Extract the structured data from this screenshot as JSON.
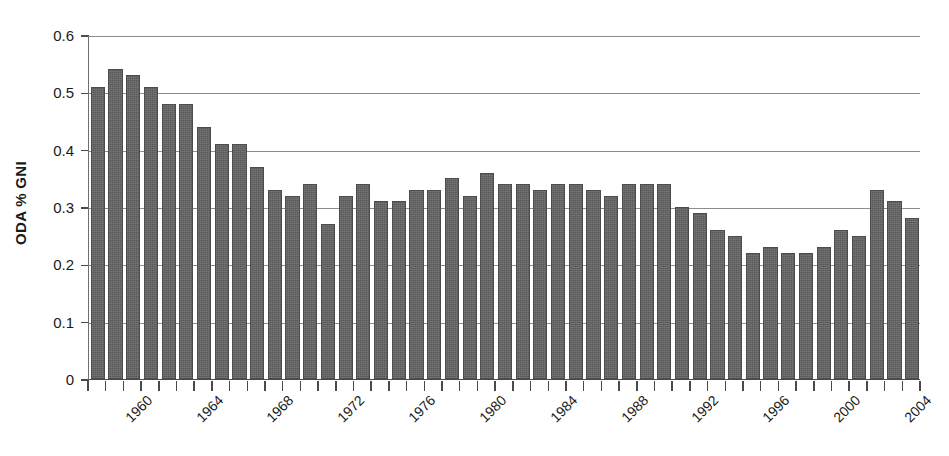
{
  "chart_data": {
    "type": "bar",
    "title": "",
    "subtitle": "",
    "xlabel": "",
    "ylabel": "ODA % GNI",
    "ylim": [
      0,
      0.6
    ],
    "ytick_labels": [
      "0.6",
      "0.5",
      "0.4",
      "0.3",
      "0.2",
      "0.1",
      "0"
    ],
    "ytick_values": [
      0.6,
      0.5,
      0.4,
      0.3,
      0.2,
      0.1,
      0
    ],
    "grid": "horizontal",
    "legend": "none",
    "bar_color": "#595959",
    "axis_color": "#4a4a4a",
    "gridline_color": "#8d8d8d",
    "xtick_label_rotation_deg": -45,
    "xtick_labels_shown": [
      "1960",
      "1964",
      "1968",
      "1972",
      "1976",
      "1980",
      "1984",
      "1988",
      "1992",
      "1996",
      "2000",
      "2004"
    ],
    "categories": [
      "1960",
      "1961",
      "1962",
      "1963",
      "1964",
      "1965",
      "1966",
      "1967",
      "1968",
      "1969",
      "1970",
      "1971",
      "1972",
      "1973",
      "1974",
      "1975",
      "1976",
      "1977",
      "1978",
      "1979",
      "1980",
      "1981",
      "1982",
      "1983",
      "1984",
      "1985",
      "1986",
      "1987",
      "1988",
      "1989",
      "1990",
      "1991",
      "1992",
      "1993",
      "1994",
      "1995",
      "1996",
      "1997",
      "1998",
      "1999",
      "2000",
      "2001",
      "2002",
      "2003",
      "2004",
      "2005",
      "2006"
    ],
    "values": [
      0.51,
      0.54,
      0.53,
      0.51,
      0.48,
      0.48,
      0.44,
      0.41,
      0.41,
      0.37,
      0.33,
      0.32,
      0.34,
      0.27,
      0.32,
      0.34,
      0.31,
      0.31,
      0.33,
      0.33,
      0.35,
      0.32,
      0.36,
      0.34,
      0.34,
      0.33,
      0.34,
      0.34,
      0.33,
      0.32,
      0.34,
      0.34,
      0.34,
      0.3,
      0.29,
      0.26,
      0.25,
      0.22,
      0.23,
      0.22,
      0.22,
      0.23,
      0.26,
      0.25,
      0.33,
      0.31,
      0.28
    ]
  }
}
